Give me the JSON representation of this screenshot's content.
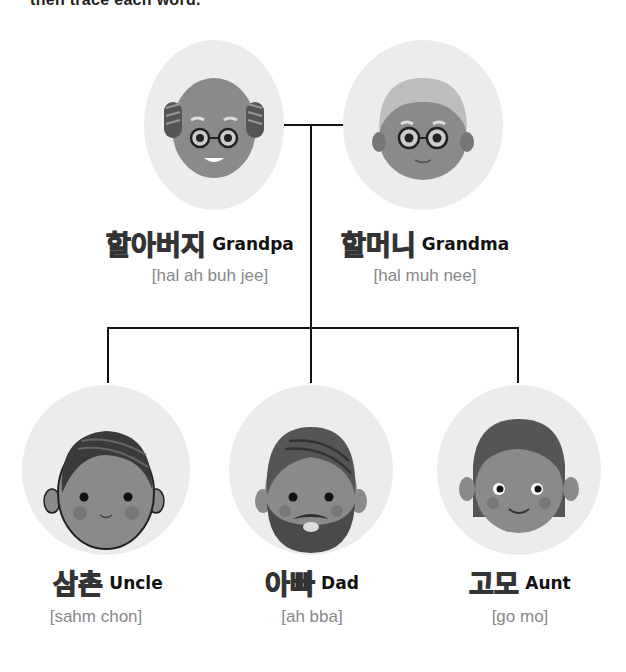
{
  "instruction": "then trace each word.",
  "members": [
    {
      "id": "grandpa",
      "korean": "할아버지",
      "english": "Grandpa",
      "pronunciation": "[hal ah buh jee]"
    },
    {
      "id": "grandma",
      "korean": "할머니",
      "english": "Grandma",
      "pronunciation": "[hal muh nee]"
    },
    {
      "id": "uncle",
      "korean": "삼촌",
      "english": "Uncle",
      "pronunciation": "[sahm chon]"
    },
    {
      "id": "dad",
      "korean": "아빠",
      "english": "Dad",
      "pronunciation": "[ah bba]"
    },
    {
      "id": "aunt",
      "korean": "고모",
      "english": "Aunt",
      "pronunciation": "[go mo]"
    }
  ],
  "colors": {
    "circle_bg": "#ececec",
    "line": "#111111",
    "pronunciation": "#888888"
  }
}
